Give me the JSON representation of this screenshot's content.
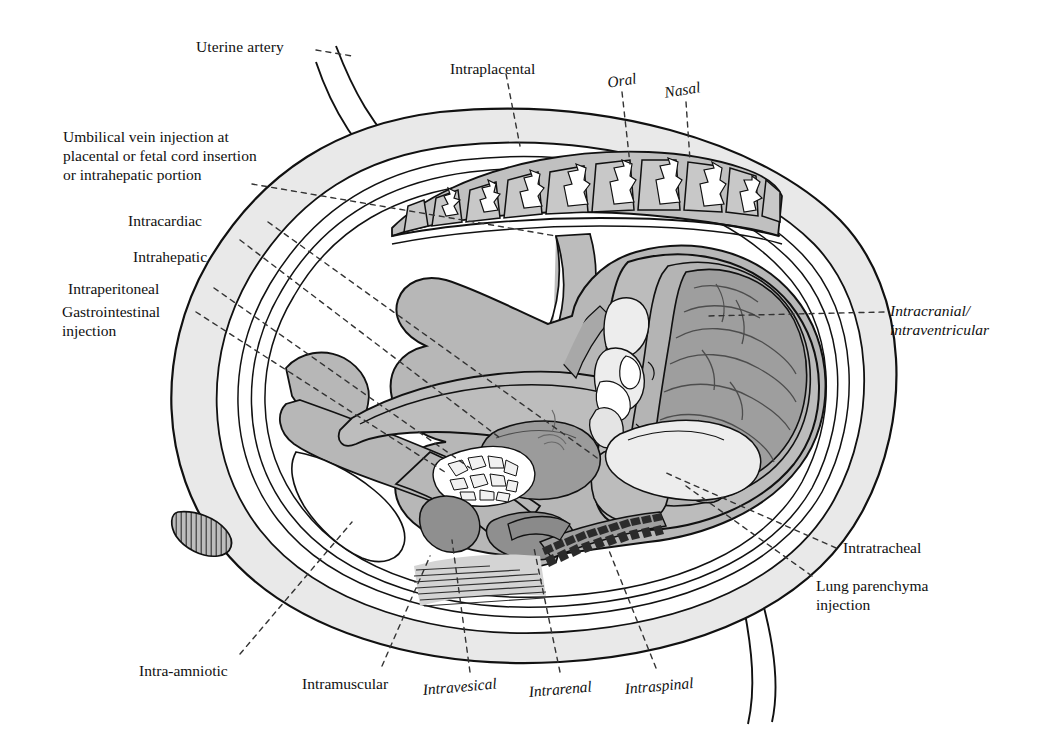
{
  "figure": {
    "background_color": "#ffffff",
    "ink_color": "#111111"
  },
  "palette": {
    "uterine_wall": "#e9e9e9",
    "amniotic_cavity": "#ffffff",
    "fetal_body": "#b9b9b9",
    "placenta_cotyledon": "#bfbfbf",
    "organ_dark": "#9a9a9a",
    "organ_light": "#ededed",
    "outline": "#111111",
    "leader_line": "#333333"
  },
  "labels": {
    "uterine_artery": "Uterine artery",
    "intraplacental": "Intraplacental",
    "oral": "Oral",
    "nasal": "Nasal",
    "umbilical_vein_line1": "Umbilical vein injection at",
    "umbilical_vein_line2": "placental or fetal cord insertion",
    "umbilical_vein_line3": "or intrahepatic portion",
    "intracardiac": "Intracardiac",
    "intrahepatic": "Intrahepatic",
    "intraperitoneal": "Intraperitoneal",
    "gastrointestinal_line1": "Gastrointestinal",
    "gastrointestinal_line2": "injection",
    "intracranial_line1": "Intracranial/",
    "intracranial_line2": "intraventricular",
    "intratracheal": "Intratracheal",
    "lung_parenchyma_line1": "Lung parenchyma",
    "lung_parenchyma_line2": "injection",
    "intra_amniotic": "Intra-amniotic",
    "intramuscular": "Intramuscular",
    "intravesical": "Intravesical",
    "intrarenal": "Intrarenal",
    "intraspinal": "Intraspinal"
  },
  "anatomy": {
    "uterus": "uterine-wall",
    "placenta": "placenta",
    "cotyledon_count": 10,
    "fetus": "fetus",
    "brain": "fetal-brain",
    "cerebellum": "cerebellum",
    "liver": "fetal-liver",
    "intestines": "fetal-intestines",
    "kidney": "fetal-kidney",
    "bladder": "fetal-bladder",
    "lung": "fetal-lung",
    "spine": "fetal-spine",
    "muscle": "gluteal-muscle",
    "umbilical_cord": "umbilical-cord",
    "cervix": "cervix",
    "membranes": "amnion-chorion-membranes",
    "uterine_artery_vessels": "uterine-artery-vessels"
  }
}
